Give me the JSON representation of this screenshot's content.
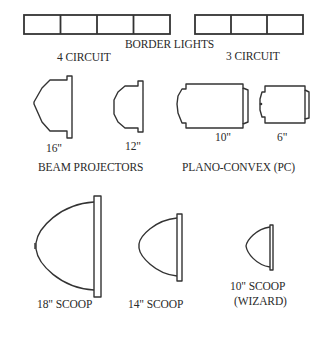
{
  "border_lights": {
    "title": "BORDER LIGHTS",
    "four_circuit": {
      "label": "4 CIRCUIT",
      "cells": 4
    },
    "three_circuit": {
      "label": "3 CIRCUIT",
      "cells": 3
    }
  },
  "beam_projectors": {
    "title": "BEAM PROJECTORS",
    "items": [
      {
        "size": "16\""
      },
      {
        "size": "12\""
      }
    ]
  },
  "plano_convex": {
    "title": "PLANO-CONVEX (PC)",
    "items": [
      {
        "size": "10\""
      },
      {
        "size": "6\""
      }
    ]
  },
  "scoops": {
    "items": [
      {
        "label": "18\" SCOOP"
      },
      {
        "label": "14\" SCOOP"
      },
      {
        "label": "10\" SCOOP",
        "sublabel": "(WIZARD)"
      }
    ]
  },
  "colors": {
    "line": "#333333",
    "text": "#2a2a2a",
    "background": "#ffffff"
  }
}
